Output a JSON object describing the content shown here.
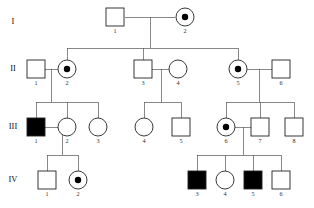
{
  "figure": {
    "type": "pedigree-chart",
    "width": 314,
    "height": 208,
    "background": "#ffffff",
    "line_color": "#555555",
    "symbol_stroke": "#222222",
    "affected_fill": "#000000",
    "unaffected_fill": "#ffffff",
    "carrier_dot_color": "#000000"
  },
  "legend_semantics": {
    "square": "male",
    "circle": "female",
    "filled": "affected",
    "open": "unaffected",
    "center_dot": "carrier"
  },
  "generations": [
    {
      "label": "I",
      "x": 13,
      "y": 22
    },
    {
      "label": "II",
      "x": 13,
      "y": 69
    },
    {
      "label": "III",
      "x": 13,
      "y": 127
    },
    {
      "label": "IV",
      "x": 13,
      "y": 180
    }
  ],
  "individuals": [
    {
      "id": "I-1",
      "number": "1",
      "generation": "I",
      "shape": "square",
      "status": "unaffected",
      "carrier": false,
      "cx": 115,
      "cy": 17
    },
    {
      "id": "I-2",
      "number": "2",
      "generation": "I",
      "shape": "circle",
      "status": "unaffected",
      "carrier": true,
      "cx": 185,
      "cy": 17
    },
    {
      "id": "II-1",
      "number": "1",
      "generation": "II",
      "shape": "square",
      "status": "unaffected",
      "carrier": false,
      "cx": 36,
      "cy": 69
    },
    {
      "id": "II-2",
      "number": "2",
      "generation": "II",
      "shape": "circle",
      "status": "unaffected",
      "carrier": true,
      "cx": 67,
      "cy": 69
    },
    {
      "id": "II-3",
      "number": "3",
      "generation": "II",
      "shape": "square",
      "status": "unaffected",
      "carrier": false,
      "cx": 143,
      "cy": 69
    },
    {
      "id": "II-4",
      "number": "4",
      "generation": "II",
      "shape": "circle",
      "status": "unaffected",
      "carrier": false,
      "cx": 178,
      "cy": 69
    },
    {
      "id": "II-5",
      "number": "5",
      "generation": "II",
      "shape": "circle",
      "status": "unaffected",
      "carrier": true,
      "cx": 238,
      "cy": 69
    },
    {
      "id": "II-6",
      "number": "6",
      "generation": "II",
      "shape": "square",
      "status": "unaffected",
      "carrier": false,
      "cx": 281,
      "cy": 69
    },
    {
      "id": "III-1",
      "number": "1",
      "generation": "III",
      "shape": "square",
      "status": "affected",
      "carrier": false,
      "cx": 36,
      "cy": 127
    },
    {
      "id": "III-2",
      "number": "2",
      "generation": "III",
      "shape": "circle",
      "status": "unaffected",
      "carrier": false,
      "cx": 67,
      "cy": 127
    },
    {
      "id": "III-3",
      "number": "3",
      "generation": "III",
      "shape": "circle",
      "status": "unaffected",
      "carrier": false,
      "cx": 98,
      "cy": 127
    },
    {
      "id": "III-4",
      "number": "4",
      "generation": "III",
      "shape": "circle",
      "status": "unaffected",
      "carrier": false,
      "cx": 144,
      "cy": 127
    },
    {
      "id": "III-5",
      "number": "5",
      "generation": "III",
      "shape": "square",
      "status": "unaffected",
      "carrier": false,
      "cx": 181,
      "cy": 127
    },
    {
      "id": "III-6",
      "number": "6",
      "generation": "III",
      "shape": "circle",
      "status": "unaffected",
      "carrier": true,
      "cx": 226,
      "cy": 127
    },
    {
      "id": "III-7",
      "number": "7",
      "generation": "III",
      "shape": "square",
      "status": "unaffected",
      "carrier": false,
      "cx": 260,
      "cy": 127
    },
    {
      "id": "III-8",
      "number": "8",
      "generation": "III",
      "shape": "square",
      "status": "unaffected",
      "carrier": false,
      "cx": 294,
      "cy": 127
    },
    {
      "id": "IV-1",
      "number": "1",
      "generation": "IV",
      "shape": "square",
      "status": "unaffected",
      "carrier": false,
      "cx": 47,
      "cy": 180
    },
    {
      "id": "IV-2",
      "number": "2",
      "generation": "IV",
      "shape": "circle",
      "status": "unaffected",
      "carrier": true,
      "cx": 78,
      "cy": 180
    },
    {
      "id": "IV-3",
      "number": "3",
      "generation": "IV",
      "shape": "square",
      "status": "affected",
      "carrier": false,
      "cx": 197,
      "cy": 180
    },
    {
      "id": "IV-4",
      "number": "4",
      "generation": "IV",
      "shape": "circle",
      "status": "unaffected",
      "carrier": false,
      "cx": 225,
      "cy": 180
    },
    {
      "id": "IV-5",
      "number": "5",
      "generation": "IV",
      "shape": "square",
      "status": "affected",
      "carrier": false,
      "cx": 253,
      "cy": 180
    },
    {
      "id": "IV-6",
      "number": "6",
      "generation": "IV",
      "shape": "square",
      "status": "unaffected",
      "carrier": false,
      "cx": 281,
      "cy": 180
    }
  ],
  "mating_lines": [
    {
      "name": "mate-I1-I2",
      "x1": 125,
      "y1": 17,
      "x2": 175,
      "y2": 17
    },
    {
      "name": "mate-II1-II2",
      "x1": 45,
      "y1": 69,
      "x2": 58,
      "y2": 69
    },
    {
      "name": "mate-II3-II4",
      "x1": 152,
      "y1": 69,
      "x2": 169,
      "y2": 69
    },
    {
      "name": "mate-II5-II6",
      "x1": 247,
      "y1": 69,
      "x2": 272,
      "y2": 69
    },
    {
      "name": "mate-III1-III2",
      "x1": 45,
      "y1": 127,
      "x2": 58,
      "y2": 127
    },
    {
      "name": "mate-III6-III7",
      "x1": 235,
      "y1": 127,
      "x2": 251,
      "y2": 127
    }
  ],
  "descent_lines": [
    {
      "name": "descent-I-drop",
      "x1": 150,
      "y1": 17,
      "x2": 150,
      "y2": 48
    },
    {
      "name": "descent-I-sibship",
      "x1": 67,
      "y1": 48,
      "x2": 238,
      "y2": 48
    },
    {
      "name": "descent-I-to-II2",
      "x1": 67,
      "y1": 48,
      "x2": 67,
      "y2": 60
    },
    {
      "name": "descent-I-to-II3",
      "x1": 143,
      "y1": 48,
      "x2": 143,
      "y2": 60
    },
    {
      "name": "descent-I-to-II5",
      "x1": 238,
      "y1": 48,
      "x2": 238,
      "y2": 60
    },
    {
      "name": "descent-IIa-drop",
      "x1": 51,
      "y1": 69,
      "x2": 51,
      "y2": 102
    },
    {
      "name": "descent-IIa-sibship",
      "x1": 36,
      "y1": 102,
      "x2": 98,
      "y2": 102
    },
    {
      "name": "descent-IIa-to-III1",
      "x1": 36,
      "y1": 102,
      "x2": 36,
      "y2": 118
    },
    {
      "name": "descent-IIa-to-III2",
      "x1": 67,
      "y1": 102,
      "x2": 67,
      "y2": 118
    },
    {
      "name": "descent-IIa-to-III3",
      "x1": 98,
      "y1": 102,
      "x2": 98,
      "y2": 118
    },
    {
      "name": "descent-IIb-drop",
      "x1": 161,
      "y1": 69,
      "x2": 161,
      "y2": 102
    },
    {
      "name": "descent-IIb-sibship",
      "x1": 144,
      "y1": 102,
      "x2": 181,
      "y2": 102
    },
    {
      "name": "descent-IIb-to-III4",
      "x1": 144,
      "y1": 102,
      "x2": 144,
      "y2": 118
    },
    {
      "name": "descent-IIb-to-III5",
      "x1": 181,
      "y1": 102,
      "x2": 181,
      "y2": 118
    },
    {
      "name": "descent-IIc-drop",
      "x1": 259,
      "y1": 69,
      "x2": 259,
      "y2": 102
    },
    {
      "name": "descent-IIc-sibship",
      "x1": 226,
      "y1": 102,
      "x2": 294,
      "y2": 102
    },
    {
      "name": "descent-IIc-to-III6",
      "x1": 226,
      "y1": 102,
      "x2": 226,
      "y2": 118
    },
    {
      "name": "descent-IIc-to-III7",
      "x1": 260,
      "y1": 102,
      "x2": 260,
      "y2": 118
    },
    {
      "name": "descent-IIc-to-III8",
      "x1": 294,
      "y1": 102,
      "x2": 294,
      "y2": 118
    },
    {
      "name": "descent-IIIa-drop",
      "x1": 62,
      "y1": 127,
      "x2": 62,
      "y2": 155
    },
    {
      "name": "descent-IIIa-sibship",
      "x1": 47,
      "y1": 155,
      "x2": 78,
      "y2": 155
    },
    {
      "name": "descent-IIIa-to-IV1",
      "x1": 47,
      "y1": 155,
      "x2": 47,
      "y2": 171
    },
    {
      "name": "descent-IIIa-to-IV2",
      "x1": 78,
      "y1": 155,
      "x2": 78,
      "y2": 171
    },
    {
      "name": "descent-IIIb-drop",
      "x1": 243,
      "y1": 127,
      "x2": 243,
      "y2": 155
    },
    {
      "name": "descent-IIIb-sibship",
      "x1": 197,
      "y1": 155,
      "x2": 281,
      "y2": 155
    },
    {
      "name": "descent-IIIb-to-IV3",
      "x1": 197,
      "y1": 155,
      "x2": 197,
      "y2": 171
    },
    {
      "name": "descent-IIIb-to-IV4",
      "x1": 225,
      "y1": 155,
      "x2": 225,
      "y2": 171
    },
    {
      "name": "descent-IIIb-to-IV5",
      "x1": 253,
      "y1": 155,
      "x2": 253,
      "y2": 171
    },
    {
      "name": "descent-IIIb-to-IV6",
      "x1": 281,
      "y1": 155,
      "x2": 281,
      "y2": 171
    }
  ],
  "symbol_geometry": {
    "square_size": 18,
    "circle_radius": 9,
    "carrier_dot_radius": 3.2,
    "label_offset_y": 11
  }
}
